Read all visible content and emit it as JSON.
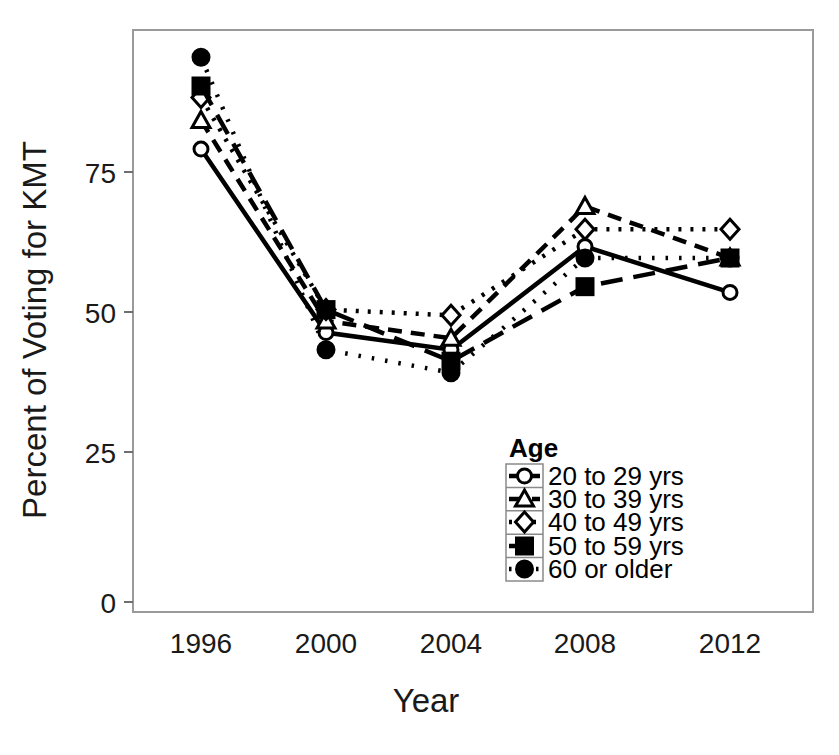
{
  "chart_data": {
    "type": "line",
    "title": "",
    "xlabel": "Year",
    "ylabel": "Percent of Voting for KMT",
    "x": [
      1996,
      2000,
      2004,
      2008,
      2012
    ],
    "xticklabels": [
      "1996",
      "2000",
      "2004",
      "2008",
      "2012"
    ],
    "yticklabels": [
      "0",
      "25",
      "50",
      "75"
    ],
    "ytickvalues": [
      0,
      25,
      50,
      75
    ],
    "ylim": [
      -3,
      100
    ],
    "xlim": [
      1994.2,
      2014.0
    ],
    "grid": false,
    "legend_position": "lower-right",
    "legend_title": "Age",
    "series": [
      {
        "name": "20 to 29 yrs",
        "values": [
          79,
          47,
          44,
          62,
          54
        ],
        "marker": "open-circle",
        "line_style": "solid"
      },
      {
        "name": "30 to 39 yrs",
        "values": [
          84,
          49,
          46,
          69,
          60
        ],
        "marker": "open-triangle",
        "line_style": "dashed-short"
      },
      {
        "name": "40 to 49 yrs",
        "values": [
          88,
          51,
          50,
          65,
          65
        ],
        "marker": "open-diamond",
        "line_style": "dotted"
      },
      {
        "name": "50 to 59 yrs",
        "values": [
          90,
          51,
          42,
          55,
          60
        ],
        "marker": "filled-square",
        "line_style": "dashed-long"
      },
      {
        "name": "60 or older",
        "values": [
          95,
          44,
          40,
          60,
          60
        ],
        "marker": "filled-circle",
        "line_style": "dotted-fine"
      }
    ]
  },
  "axes": {
    "x_title": "Year",
    "y_title": "Percent of Voting for KMT"
  },
  "legend": {
    "title": "Age",
    "items": [
      {
        "label": "20 to 29 yrs"
      },
      {
        "label": "30 to 39 yrs"
      },
      {
        "label": "40 to 49 yrs"
      },
      {
        "label": "50 to 59 yrs"
      },
      {
        "label": "60 or older"
      }
    ]
  },
  "ticks": {
    "y": [
      "75",
      "50",
      "25",
      "0"
    ],
    "x": [
      "1996",
      "2000",
      "2004",
      "2008",
      "2012"
    ]
  }
}
